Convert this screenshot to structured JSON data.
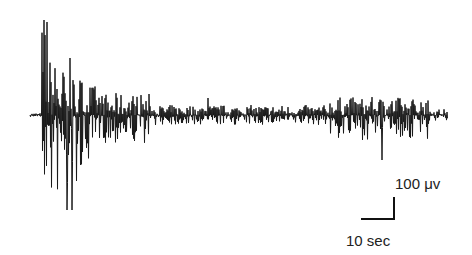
{
  "chart_data": {
    "type": "line",
    "title": "",
    "xlabel": "",
    "ylabel": "",
    "baseline_y_px": 115,
    "trace_color": "#1a1a1a",
    "scale_bar": {
      "amplitude_label": "100 μv",
      "time_label": "10 sec",
      "amplitude_value": 100,
      "amplitude_unit": "μV",
      "time_value": 10,
      "time_unit": "sec"
    },
    "segments": [
      {
        "x_start": 30,
        "x_end": 42,
        "amp": 2
      },
      {
        "x_start": 42,
        "x_end": 48,
        "amp_up": 95,
        "amp_down": 70
      },
      {
        "x_start": 48,
        "x_end": 100,
        "amp_up": 60,
        "amp_down": 95
      },
      {
        "x_start": 100,
        "x_end": 150,
        "amp_up": 22,
        "amp_down": 28
      },
      {
        "x_start": 150,
        "x_end": 330,
        "amp_up": 10,
        "amp_down": 10
      },
      {
        "x_start": 330,
        "x_end": 430,
        "amp_up": 18,
        "amp_down": 25
      },
      {
        "x_start": 430,
        "x_end": 448,
        "amp_up": 6,
        "amp_down": 6
      }
    ],
    "notable_peaks": [
      {
        "x": 44,
        "y_px": 20
      },
      {
        "x": 47,
        "y_px": 22
      },
      {
        "x": 70,
        "y_px": 58
      },
      {
        "x": 67,
        "y_px": 210
      },
      {
        "x": 72,
        "y_px": 210
      },
      {
        "x": 208,
        "y_px": 98
      },
      {
        "x": 382,
        "y_px": 160
      },
      {
        "x": 426,
        "y_px": 103
      }
    ]
  },
  "labels": {
    "amplitude": "100 μv",
    "time": "10 sec"
  }
}
